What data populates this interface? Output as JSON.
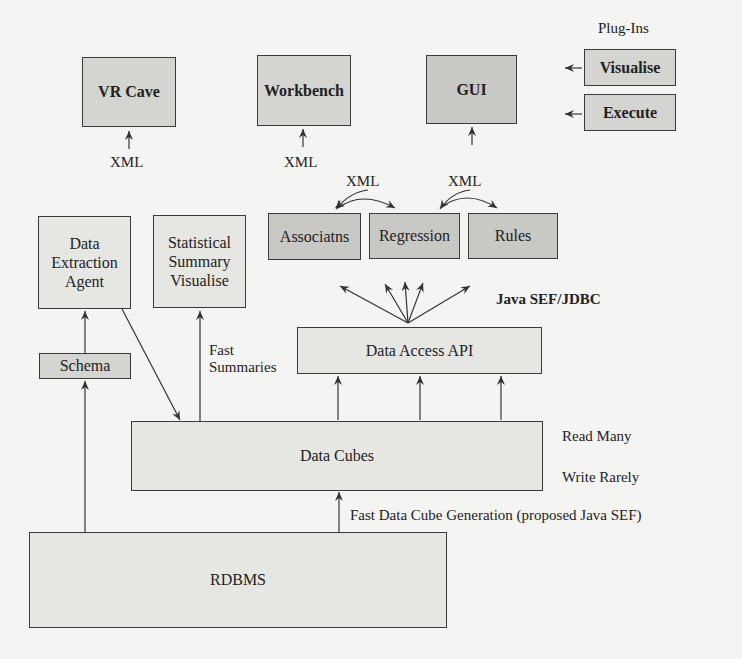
{
  "diagram": {
    "plugins_label": "Plug-Ins",
    "boxes": {
      "vr_cave": "VR Cave",
      "workbench": "Workbench",
      "gui": "GUI",
      "visualise": "Visualise",
      "execute": "Execute",
      "associations": "Associatns",
      "regression": "Regression",
      "rules": "Rules",
      "data_extraction_agent": [
        "Data",
        "Extraction",
        "Agent"
      ],
      "statistical_summary_visualise": [
        "Statistical",
        "Summary",
        "Visualise"
      ],
      "schema": "Schema",
      "data_access_api": "Data Access API",
      "data_cubes": "Data Cubes",
      "rdbms": "RDBMS"
    },
    "labels": {
      "xml_vr_cave": "XML",
      "xml_workbench": "XML",
      "xml_left": "XML",
      "xml_right": "XML",
      "java_sef_jdbc": "Java SEF/JDBC",
      "fast_summaries": [
        "Fast",
        "Summaries"
      ],
      "read_many": "Read Many",
      "write_rarely": "Write Rarely",
      "fast_data_cube_generation": "Fast Data Cube Generation (proposed Java SEF)"
    }
  }
}
